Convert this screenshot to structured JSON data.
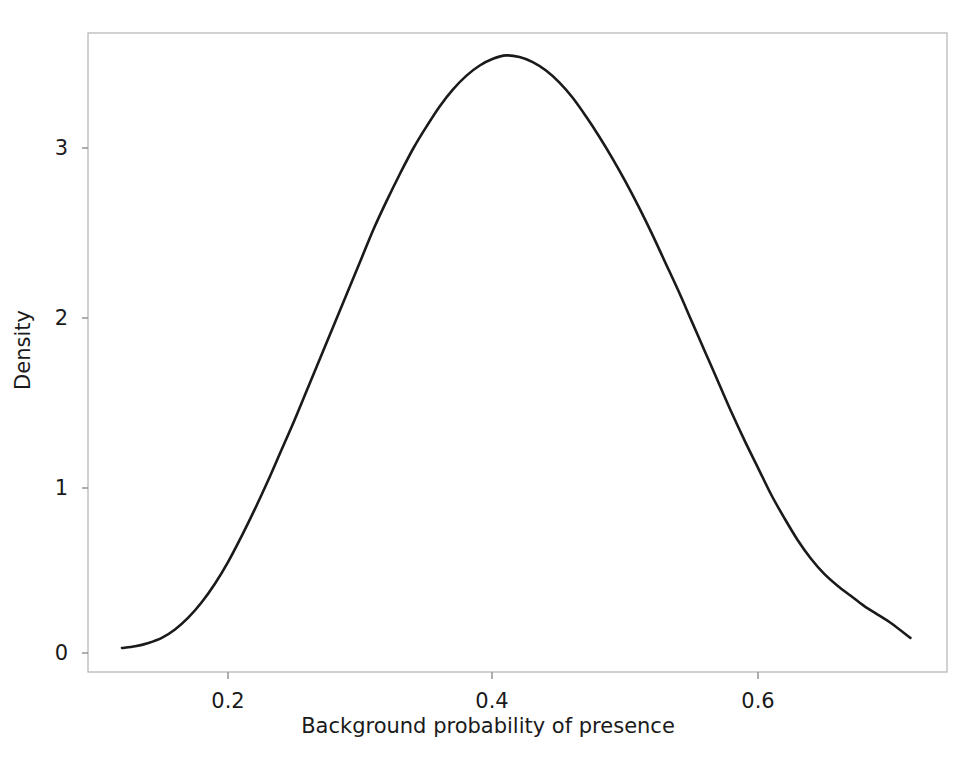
{
  "chart_data": {
    "type": "line",
    "title": "",
    "subtitle": "",
    "xlabel": "Background probability of presence",
    "ylabel": "Density",
    "xlim": [
      0.106,
      0.756
    ],
    "ylim": [
      -0.11,
      3.69
    ],
    "xticks": [
      0.2,
      0.4,
      0.6
    ],
    "xticklabels": [
      "0.2",
      "0.4",
      "0.6"
    ],
    "yticks": [
      0,
      1,
      2,
      3
    ],
    "yticklabels": [
      "0",
      "1",
      "2",
      "3"
    ],
    "grid": false,
    "legend": false,
    "legend_position": "none",
    "line_color": "#1a1a1a",
    "line_width": 2.6,
    "frame_color": "#b4b4b4",
    "background_color": "#ffffff",
    "annotations": [],
    "series": [
      {
        "name": "Kernel density of background probability of presence",
        "x": [
          0.12,
          0.13,
          0.14,
          0.15,
          0.16,
          0.17,
          0.18,
          0.19,
          0.2,
          0.21,
          0.22,
          0.23,
          0.24,
          0.25,
          0.26,
          0.27,
          0.28,
          0.29,
          0.3,
          0.31,
          0.32,
          0.33,
          0.34,
          0.35,
          0.36,
          0.37,
          0.38,
          0.39,
          0.4,
          0.41,
          0.42,
          0.43,
          0.44,
          0.45,
          0.46,
          0.47,
          0.48,
          0.49,
          0.5,
          0.51,
          0.52,
          0.53,
          0.54,
          0.55,
          0.56,
          0.57,
          0.58,
          0.59,
          0.6,
          0.61,
          0.62,
          0.63,
          0.64,
          0.65,
          0.66,
          0.67,
          0.68,
          0.69,
          0.7,
          0.715
        ],
        "y": [
          0.03,
          0.04,
          0.06,
          0.09,
          0.14,
          0.21,
          0.3,
          0.41,
          0.54,
          0.69,
          0.85,
          1.02,
          1.2,
          1.38,
          1.57,
          1.76,
          1.95,
          2.14,
          2.33,
          2.52,
          2.69,
          2.85,
          3.0,
          3.13,
          3.25,
          3.35,
          3.43,
          3.49,
          3.53,
          3.55,
          3.54,
          3.51,
          3.46,
          3.39,
          3.3,
          3.19,
          3.07,
          2.94,
          2.8,
          2.65,
          2.49,
          2.32,
          2.15,
          1.97,
          1.79,
          1.61,
          1.43,
          1.26,
          1.1,
          0.94,
          0.8,
          0.67,
          0.56,
          0.47,
          0.4,
          0.34,
          0.28,
          0.23,
          0.18,
          0.09
        ]
      }
    ],
    "peak": {
      "x": 0.41,
      "y": 3.55
    }
  },
  "axes": {
    "x_title": "Background probability of presence",
    "y_title": "Density",
    "x_tick_labels": [
      "0.2",
      "0.4",
      "0.6"
    ],
    "y_tick_labels": [
      "0",
      "1",
      "2",
      "3"
    ]
  }
}
